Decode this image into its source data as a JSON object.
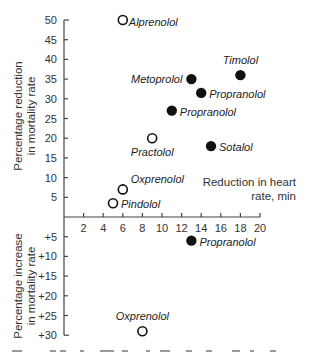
{
  "chart_data": {
    "type": "scatter",
    "title": "",
    "xlabel": "Reduction in heart rate, min",
    "xlabel_lines": [
      "Reduction in heart",
      "rate, min"
    ],
    "ylabel_upper_lines": [
      "Percentage reduction",
      "in mortality rate"
    ],
    "ylabel_lower_lines": [
      "Percentage increase",
      "in mortality rate"
    ],
    "xlim": [
      0,
      20
    ],
    "ylim": [
      -30,
      50
    ],
    "x_ticks": [
      2,
      4,
      6,
      8,
      10,
      12,
      14,
      16,
      18,
      20
    ],
    "x_tick_labels": [
      "2",
      "4",
      "6",
      "8",
      "10",
      "12",
      "14",
      "16",
      "18",
      "20"
    ],
    "y_ticks": [
      50,
      45,
      40,
      35,
      30,
      25,
      20,
      15,
      10,
      5,
      -5,
      -10,
      -15,
      -20,
      -25,
      -30
    ],
    "y_tick_labels": [
      "50",
      "45",
      "40",
      "35",
      "30",
      "25",
      "20",
      "15",
      "10",
      "5",
      "+5",
      "+10",
      "+15",
      "+20",
      "+25",
      "+30"
    ],
    "grid": false,
    "legend": null,
    "marker_styles": {
      "filled": "solid black circle",
      "open": "hollow circle"
    },
    "points": [
      {
        "label": "Alprenolol",
        "x": 6,
        "y": 50,
        "marker": "open",
        "label_pos": "right"
      },
      {
        "label": "Metoprolol",
        "x": 13,
        "y": 35,
        "marker": "filled",
        "label_pos": "left"
      },
      {
        "label": "Timolol",
        "x": 18,
        "y": 36,
        "marker": "filled",
        "label_pos": "above"
      },
      {
        "label": "Propranolol",
        "x": 14,
        "y": 31.5,
        "marker": "filled",
        "label_pos": "right"
      },
      {
        "label": "Propranolol",
        "x": 11,
        "y": 27,
        "marker": "filled",
        "label_pos": "right"
      },
      {
        "label": "Practolol",
        "x": 9,
        "y": 20,
        "marker": "open",
        "label_pos": "below"
      },
      {
        "label": "Sotalol",
        "x": 15,
        "y": 18,
        "marker": "filled",
        "label_pos": "right"
      },
      {
        "label": "Oxprenolol",
        "x": 6,
        "y": 7,
        "marker": "open",
        "label_pos": "above-right"
      },
      {
        "label": "Pindolol",
        "x": 5,
        "y": 3.5,
        "marker": "open",
        "label_pos": "right"
      },
      {
        "label": "Propranolol",
        "x": 13,
        "y": -6,
        "marker": "filled",
        "label_pos": "right"
      },
      {
        "label": "Oxprenolol",
        "x": 8,
        "y": -29,
        "marker": "open",
        "label_pos": "above"
      }
    ]
  }
}
